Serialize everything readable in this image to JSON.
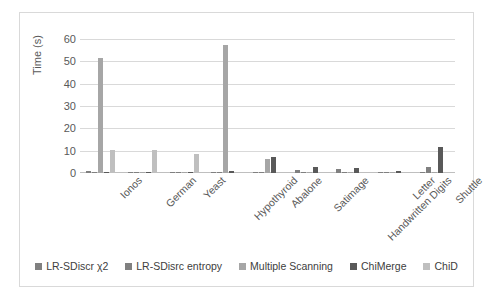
{
  "chart_data": {
    "type": "bar",
    "title": "",
    "xlabel": "",
    "ylabel": "Time (s)",
    "ylim": [
      0,
      60
    ],
    "yticks": [
      0,
      10,
      20,
      30,
      40,
      50,
      60
    ],
    "grid": true,
    "legend_position": "bottom",
    "categories": [
      "Ionos",
      "German",
      "Yeast",
      "Hypothyroid",
      "Abalone",
      "Satimage",
      "Handwritten Digits",
      "Letter",
      "Shuttle"
    ],
    "series": [
      {
        "name": "LR-SDiscr χ2",
        "color": "#808080",
        "values": [
          0.9,
          0.1,
          0.3,
          0.1,
          0.6,
          1.4,
          1.8,
          0.3,
          0.2
        ]
      },
      {
        "name": "LR-SDisrc  entropy",
        "color": "#808080",
        "values": [
          0.5,
          0.1,
          0.3,
          0.1,
          0.5,
          0.3,
          0.1,
          0.4,
          2.8
        ]
      },
      {
        "name": "Multiple Scanning",
        "color": "#a6a6a6",
        "values": [
          51.5,
          0.1,
          0.2,
          57.2,
          6.1,
          0.2,
          0.2,
          0.2,
          0.2
        ]
      },
      {
        "name": "ChiMerge",
        "color": "#595959",
        "values": [
          0.4,
          0.1,
          0.1,
          0.7,
          7.1,
          2.6,
          2.4,
          0.9,
          11.7
        ]
      },
      {
        "name": "ChiD",
        "color": "#bfbfbf",
        "values": [
          10.4,
          10.3,
          8.5,
          0.2,
          0.3,
          0.2,
          0.2,
          0.2,
          0.2
        ]
      }
    ]
  },
  "axis": {
    "y_title": "Time (s)",
    "tick_labels": [
      "60",
      "50",
      "40",
      "30",
      "20",
      "10",
      "0"
    ]
  },
  "legend": {
    "items": [
      {
        "label": "LR-SDiscr χ2",
        "color": "#808080"
      },
      {
        "label": "LR-SDisrc  entropy",
        "color": "#808080"
      },
      {
        "label": "Multiple Scanning",
        "color": "#a6a6a6"
      },
      {
        "label": "ChiMerge",
        "color": "#595959"
      },
      {
        "label": "ChiD",
        "color": "#bfbfbf"
      }
    ]
  }
}
